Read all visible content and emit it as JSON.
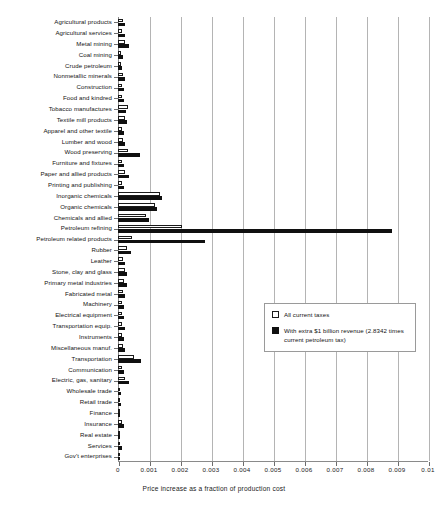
{
  "chart_data": {
    "type": "bar",
    "orientation": "horizontal",
    "title": "",
    "xlabel": "Price increase as a fraction of production cost",
    "ylabel": "",
    "xlim": [
      0,
      0.01
    ],
    "xticks": [
      "0",
      "0.001",
      "0.002",
      "0.003",
      "0.004",
      "0.005",
      "0.006",
      "0.007",
      "0.008",
      "0.009",
      "0.01"
    ],
    "xtick_values": [
      0,
      0.001,
      0.002,
      0.003,
      0.004,
      0.005,
      0.006,
      0.007,
      0.008,
      0.009,
      0.01
    ],
    "grid": "vertical",
    "legend_position": "center-right",
    "legend": [
      {
        "label": "All current taxes",
        "swatch": "white"
      },
      {
        "label": "With extra $1 billion revenue (2.8342 times current petroleum tax)",
        "swatch": "black"
      }
    ],
    "categories": [
      "Agricultural products",
      "Agricultural services",
      "Metal mining",
      "Coal mining",
      "Crude petroleum",
      "Nonmetallic minerals",
      "Construction",
      "Food and kindred",
      "Tobacco manufactures",
      "Textile mill products",
      "Apparel and other textile",
      "Lumber and wood",
      "Wood preserving",
      "Furniture and fixtures",
      "Paper and allied products",
      "Printing and publishing",
      "Inorganic chemicals",
      "Organic chemicals",
      "Chemicals and allied",
      "Petroleum refining",
      "Petroleum related products",
      "Rubber",
      "Leather",
      "Stone, clay and glass",
      "Primary metal industries",
      "Fabricated metal",
      "Machinery",
      "Electrical equipment",
      "Transportation equip.",
      "Instruments",
      "Miscellaneous manuf.",
      "Transportation",
      "Communication",
      "Electric, gas, sanitary",
      "Wholesale trade",
      "Retail trade",
      "Finance",
      "Insurance",
      "Real estate",
      "Services",
      "Gov't enterprises"
    ],
    "series": [
      {
        "name": "All current taxes",
        "values": [
          0.00016,
          0.00012,
          0.00022,
          0.00011,
          9e-05,
          0.00016,
          0.00013,
          0.00013,
          0.00032,
          0.00022,
          0.00014,
          0.00016,
          0.00033,
          0.00013,
          0.00024,
          0.00013,
          0.00136,
          0.00118,
          0.0009,
          0.00205,
          0.00046,
          0.0003,
          0.00016,
          0.00022,
          0.0002,
          0.00016,
          0.00013,
          0.00013,
          0.00014,
          0.00013,
          0.00016,
          0.0005,
          0.00013,
          0.00021,
          8e-05,
          8e-05,
          5e-05,
          0.00012,
          4e-05,
          8e-05,
          4e-05
        ]
      },
      {
        "name": "With extra $1 billion revenue (2.8342 times current petroleum tax)",
        "values": [
          0.00022,
          0.00024,
          0.00036,
          0.00016,
          0.00013,
          0.00022,
          0.00019,
          0.00018,
          0.00027,
          0.0003,
          0.00019,
          0.00024,
          0.0007,
          0.00018,
          0.00036,
          0.00019,
          0.00141,
          0.00126,
          0.001,
          0.00885,
          0.00281,
          0.00042,
          0.00022,
          0.0003,
          0.00029,
          0.00023,
          0.00019,
          0.00019,
          0.00021,
          0.00018,
          0.00023,
          0.00075,
          0.0002,
          0.00034,
          0.00011,
          0.00011,
          7e-05,
          0.00019,
          5e-05,
          0.00012,
          6e-05
        ]
      }
    ]
  }
}
